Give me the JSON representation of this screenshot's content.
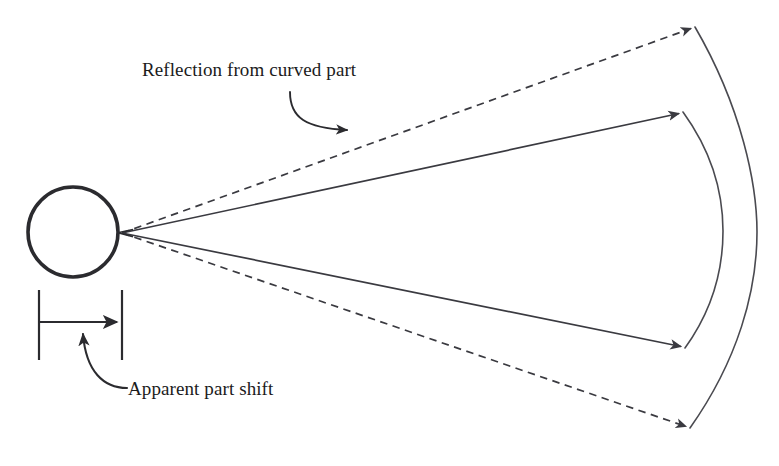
{
  "figure": {
    "type": "technical-diagram",
    "background_color": "#ffffff",
    "stroke_color": "#3a3a40",
    "heavy_stroke_color": "#2b2b2f",
    "text_color": "#1b1b1b",
    "width": 779,
    "height": 466
  },
  "labels": {
    "reflection": "Reflection from curved part",
    "apparent_shift": "Apparent part shift"
  },
  "geometry": {
    "part_circle": {
      "name": "part-circle",
      "cx": 73,
      "cy": 232,
      "r": 45,
      "stroke_width": 3.6
    },
    "convergence_point": {
      "name": "convergence-point",
      "x": 122,
      "y": 233
    },
    "rays": [
      {
        "name": "dashed-ray-upper",
        "style": "dashed",
        "from": [
          122,
          233
        ],
        "to": [
          695,
          27
        ]
      },
      {
        "name": "solid-ray-upper",
        "style": "solid",
        "from": [
          122,
          233
        ],
        "to": [
          683,
          112
        ]
      },
      {
        "name": "solid-ray-lower",
        "style": "solid",
        "from": [
          122,
          233
        ],
        "to": [
          685,
          348
        ]
      },
      {
        "name": "dashed-ray-lower",
        "style": "dashed",
        "from": [
          122,
          233
        ],
        "to": [
          690,
          428
        ]
      }
    ],
    "arcs": [
      {
        "name": "outer-arc",
        "start": [
          695,
          27
        ],
        "end": [
          690,
          428
        ],
        "bulge_x": 757
      },
      {
        "name": "inner-arc",
        "start": [
          683,
          112
        ],
        "end": [
          685,
          348
        ],
        "bulge_x": 723
      }
    ],
    "dimension": {
      "name": "apparent-shift-dimension",
      "left_tick_x": 39,
      "right_tick_x": 122,
      "tick_top_y": 290,
      "tick_bottom_y": 360,
      "arrow_y": 322
    },
    "leaders": [
      {
        "name": "reflection-leader",
        "from": [
          290,
          92
        ],
        "to": [
          352,
          132
        ]
      },
      {
        "name": "apparent-shift-leader",
        "from": [
          123,
          386
        ],
        "to": [
          83,
          329
        ]
      }
    ]
  }
}
